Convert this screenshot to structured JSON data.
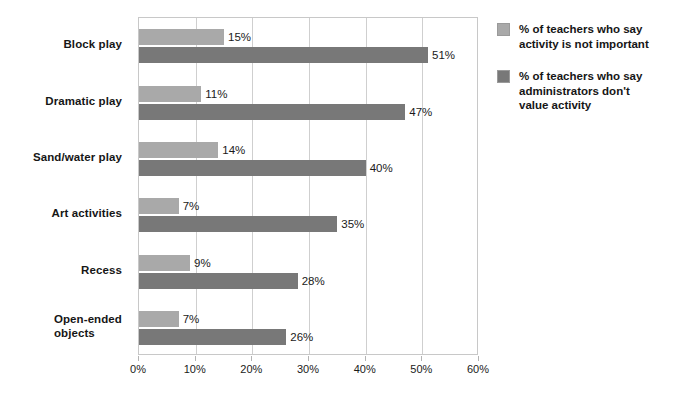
{
  "chart_data": {
    "type": "bar",
    "orientation": "horizontal",
    "title": "",
    "xlabel": "",
    "ylabel": "",
    "xlim": [
      0,
      60
    ],
    "xticks": [
      "0%",
      "10%",
      "20%",
      "30%",
      "40%",
      "50%",
      "60%"
    ],
    "xtick_values": [
      0,
      10,
      20,
      30,
      40,
      50,
      60
    ],
    "grid": true,
    "legend_position": "right",
    "categories": [
      "Block play",
      "Dramatic play",
      "Sand/water play",
      "Art activities",
      "Recess",
      "Open-ended\nobjects"
    ],
    "series": [
      {
        "name": "% of teachers who say\nactivity is not important",
        "color": "#a9a9a9",
        "values": [
          15,
          11,
          14,
          7,
          9,
          7
        ],
        "labels": [
          "15%",
          "11%",
          "14%",
          "7%",
          "9%",
          "7%"
        ]
      },
      {
        "name": "% of teachers who say\nadministrators don't\nvalue activity",
        "color": "#787878",
        "values": [
          51,
          47,
          40,
          35,
          28,
          26
        ],
        "labels": [
          "51%",
          "47%",
          "40%",
          "35%",
          "28%",
          "26%"
        ]
      }
    ]
  },
  "legend": {
    "items": [
      {
        "label": "% of teachers who say\nactivity is not important",
        "swatch": "light-gray-swatch",
        "color": "#a9a9a9"
      },
      {
        "label": "% of teachers who say\nadministrators don't\nvalue activity",
        "swatch": "dark-gray-swatch",
        "color": "#787878"
      }
    ]
  },
  "colors": {
    "series_light": "#a9a9a9",
    "series_dark": "#787878",
    "gridline": "#cfcfcf",
    "plot_border": "#c8c8c8",
    "text": "#1a1a1a",
    "background": "#ffffff"
  }
}
